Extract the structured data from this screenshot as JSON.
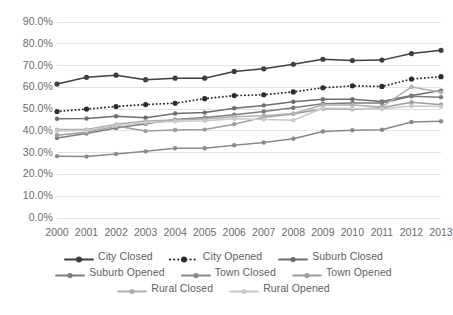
{
  "chart_data": {
    "type": "line",
    "title": "",
    "xlabel": "",
    "ylabel": "",
    "categories": [
      "2000",
      "2001",
      "2002",
      "2003",
      "2004",
      "2005",
      "2006",
      "2007",
      "2008",
      "2009",
      "2010",
      "2011",
      "2012",
      "2013"
    ],
    "x": [
      2000,
      2001,
      2002,
      2003,
      2004,
      2005,
      2006,
      2007,
      2008,
      2009,
      2010,
      2011,
      2012,
      2013
    ],
    "ylim": [
      0,
      90
    ],
    "ytick_labels": [
      "0.0%",
      "10.0%",
      "20.0%",
      "30.0%",
      "40.0%",
      "50.0%",
      "60.0%",
      "70.0%",
      "80.0%",
      "90.0%"
    ],
    "ytick_values": [
      0,
      10,
      20,
      30,
      40,
      50,
      60,
      70,
      80,
      90
    ],
    "grid": true,
    "legend_position": "bottom",
    "series": [
      {
        "name": "City Closed",
        "color": "#3f3f3f",
        "style": "solid",
        "values": [
          61.5,
          64.6,
          65.6,
          63.5,
          64.2,
          64.2,
          67.3,
          68.5,
          70.6,
          72.9,
          72.3,
          72.5,
          75.5,
          77.0
        ]
      },
      {
        "name": "City Opened",
        "color": "#2b2b2b",
        "style": "dotted",
        "values": [
          48.9,
          50.0,
          51.2,
          52.1,
          52.7,
          54.8,
          56.2,
          56.6,
          57.9,
          59.8,
          60.7,
          60.4,
          63.8,
          64.9
        ]
      },
      {
        "name": "Suburb Closed",
        "color": "#6e6e6e",
        "style": "solid",
        "values": [
          45.6,
          45.7,
          46.7,
          46.0,
          48.0,
          48.4,
          50.4,
          51.7,
          53.4,
          54.5,
          54.5,
          53.5,
          56.2,
          58.5
        ]
      },
      {
        "name": "Suburb Opened",
        "color": "#7d7d7d",
        "style": "solid",
        "values": [
          36.7,
          38.8,
          41.3,
          43.3,
          45.2,
          46.1,
          47.4,
          48.9,
          50.6,
          52.5,
          52.8,
          52.8,
          55.9,
          55.5
        ]
      },
      {
        "name": "Town Closed",
        "color": "#8a8a8a",
        "style": "solid",
        "values": [
          28.4,
          28.2,
          29.4,
          30.6,
          32.0,
          32.0,
          33.4,
          34.7,
          36.4,
          39.7,
          40.3,
          40.5,
          44.1,
          44.4
        ]
      },
      {
        "name": "Town Opened",
        "color": "#9d9d9d",
        "style": "solid",
        "values": [
          38.0,
          39.4,
          42.2,
          39.9,
          40.4,
          40.6,
          43.1,
          46.3,
          47.8,
          50.2,
          49.9,
          50.6,
          53.2,
          52.0
        ]
      },
      {
        "name": "Rural Closed",
        "color": "#b0b0b0",
        "style": "solid",
        "values": [
          40.6,
          40.6,
          43.0,
          44.5,
          45.0,
          45.5,
          46.5,
          47.0,
          48.0,
          51.9,
          51.9,
          51.0,
          60.2,
          57.7
        ]
      },
      {
        "name": "Rural Opened",
        "color": "#c9c9c9",
        "style": "solid",
        "values": [
          40.0,
          40.2,
          42.5,
          43.8,
          44.3,
          44.6,
          45.6,
          45.2,
          44.9,
          50.5,
          50.3,
          50.0,
          51.4,
          51.2
        ]
      }
    ]
  },
  "legend": {
    "rows": [
      [
        "City Closed",
        "City Opened",
        "Suburb Closed"
      ],
      [
        "Suburb Opened",
        "Town Closed",
        "Town Opened"
      ],
      [
        "Rural Closed",
        "Rural Opened"
      ]
    ]
  },
  "colors": {
    "gridline": "#e2e2e2",
    "axis_text": "#6b6b6b",
    "background": "#ffffff"
  }
}
